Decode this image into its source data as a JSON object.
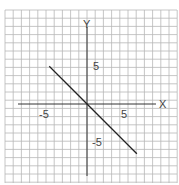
{
  "chart_data": {
    "type": "line",
    "title": "",
    "xlabel": "X",
    "ylabel": "Y",
    "xlim": [
      -11,
      12
    ],
    "ylim": [
      -10.5,
      12.5
    ],
    "grid": true,
    "tick_labels": {
      "x": [
        "-5",
        "5"
      ],
      "y": [
        "5",
        "-5"
      ]
    },
    "series": [
      {
        "name": "line",
        "equation": "y = -x",
        "x": [
          -5,
          6.6
        ],
        "y": [
          5,
          -6.6
        ]
      }
    ]
  },
  "labels": {
    "x_axis": "X",
    "y_axis": "Y",
    "x_neg5": "-5",
    "x_pos5": "5",
    "y_pos5": "5",
    "y_neg5": "-5"
  },
  "colors": {
    "grid": "#b8b8b8",
    "axis": "#333333",
    "line": "#222222"
  }
}
